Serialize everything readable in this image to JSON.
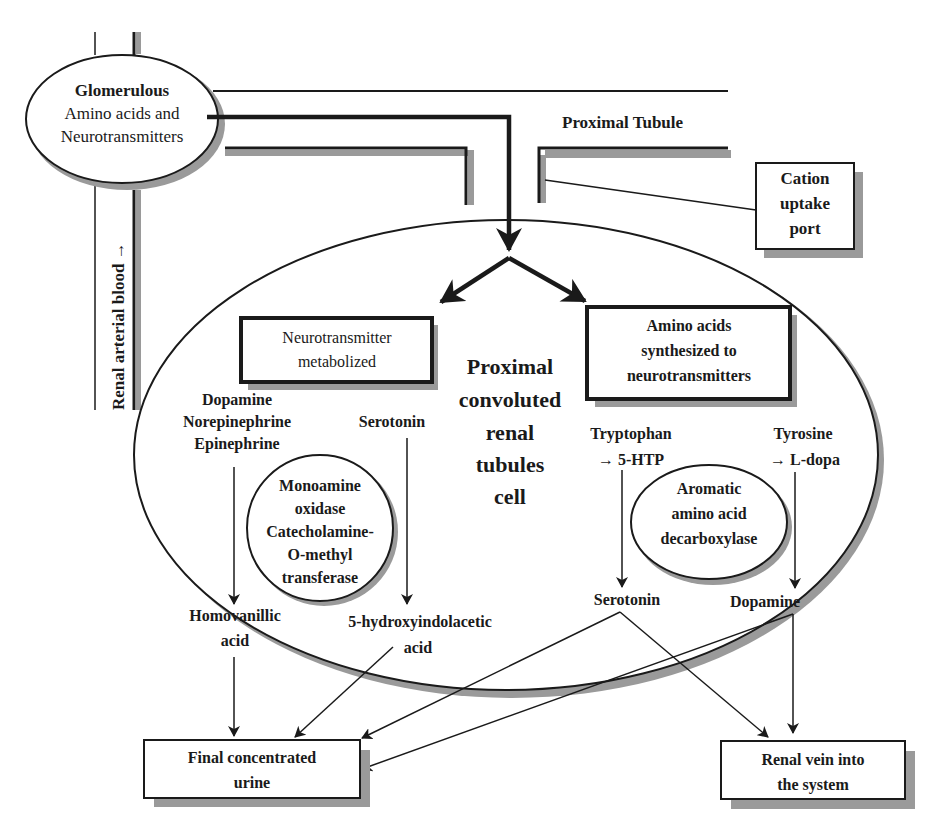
{
  "colors": {
    "ink": "#1a1a1a",
    "shadow": "#9a9a9a",
    "background": "#ffffff"
  },
  "glomerulus": {
    "title": "Glomerulous",
    "line1": "Amino acids and",
    "line2": "Neurotransmitters"
  },
  "renal_arterial_blood": "Renal arterial blood →",
  "proximal_tubule": "Proximal Tubule",
  "cation_port": {
    "line1": "Cation",
    "line2": "uptake",
    "line3": "port"
  },
  "cell": {
    "line1": "Proximal",
    "line2": "convoluted",
    "line3": "renal",
    "line4": "tubules",
    "line5": "cell"
  },
  "box_metabolized": {
    "line1": "Neurotransmitter",
    "line2": "metabolized"
  },
  "box_synthesized": {
    "line1": "Amino acids",
    "line2": "synthesized to",
    "line3": "neurotransmitters"
  },
  "catecholamines": {
    "line1": "Dopamine",
    "line2": "Norepinephrine",
    "line3": "Epinephrine"
  },
  "serotonin_in": "Serotonin",
  "enzyme_mao": {
    "line1": "Monoamine",
    "line2": "oxidase",
    "line3": "Catecholamine-",
    "line4": "O-methyl",
    "line5": "transferase"
  },
  "homovanillic": {
    "line1": "Homovanillic",
    "line2": "acid"
  },
  "hiaa": {
    "line1": "5-hydroxyindolacetic",
    "line2": "acid"
  },
  "tryptophan": {
    "line1": "Tryptophan",
    "line2": "→ 5-HTP"
  },
  "tyrosine": {
    "line1": "Tyrosine",
    "line2": "→ L-dopa"
  },
  "enzyme_aadc": {
    "line1": "Aromatic",
    "line2": "amino acid",
    "line3": "decarboxylase"
  },
  "serotonin_out": "Serotonin",
  "dopamine_out": "Dopamine",
  "urine": {
    "line1": "Final concentrated",
    "line2": "urine"
  },
  "renal_vein": {
    "line1": "Renal vein into",
    "line2": "the system"
  }
}
